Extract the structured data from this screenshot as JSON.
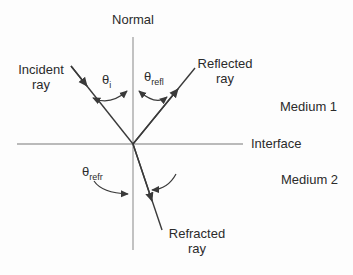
{
  "diagram": {
    "name": "reflection-refraction-ray-diagram",
    "labels": {
      "normal": "Normal",
      "incident_line1": "Incident",
      "incident_line2": "ray",
      "reflected_line1": "Reflected",
      "reflected_line2": "ray",
      "refracted_line1": "Refracted",
      "refracted_line2": "ray",
      "medium1": "Medium 1",
      "medium2": "Medium 2",
      "interface": "Interface"
    },
    "angles": {
      "incident": {
        "symbol": "θ",
        "subscript": "i"
      },
      "reflected": {
        "symbol": "θ",
        "subscript": "refl"
      },
      "refracted": {
        "symbol": "θ",
        "subscript": "refr"
      }
    },
    "colors": {
      "ray": "#3a3a3a",
      "axis_line": "#a3a3a3",
      "text": "#2b2b2b",
      "background": "#fdfdfd"
    }
  }
}
